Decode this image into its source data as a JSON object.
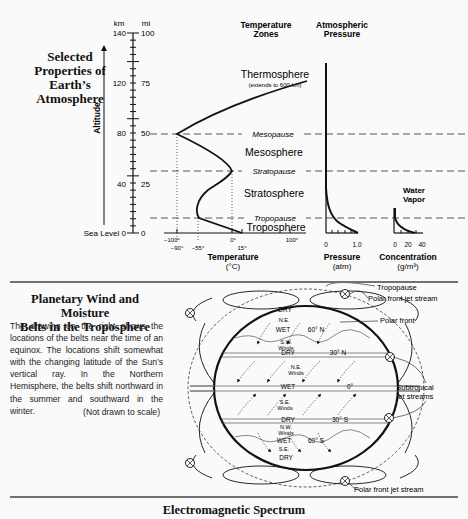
{
  "atmosphere": {
    "title": "Selected Properties of Earth’s Atmosphere",
    "title_lines": [
      "Selected",
      "Properties of",
      "Earth’s",
      "Atmosphere"
    ],
    "altitude_label": "Altitude",
    "km_label": "km",
    "mi_label": "mi",
    "km_ticks": [
      "140",
      "120",
      "80",
      "40",
      "Sea Level 0"
    ],
    "mi_ticks": [
      "100",
      "75",
      "50",
      "25",
      "0"
    ],
    "temperature_zones_header": [
      "Temperature",
      "Zones"
    ],
    "pressure_header": [
      "Atmospheric",
      "Pressure"
    ],
    "zones": {
      "thermosphere": "Thermosphere",
      "thermosphere_note": "(extends to 600 km)",
      "mesopause": "Mesopause",
      "mesosphere": "Mesosphere",
      "stratopause": "Stratopause",
      "stratosphere": "Stratosphere",
      "tropopause": "Tropopause",
      "troposphere": "Troposphere"
    },
    "temperature_axis": {
      "top_ticks": [
        "−100°",
        "0°",
        "100°"
      ],
      "bottom_ticks": [
        "−90°",
        "−55°",
        "15°"
      ],
      "label": "Temperature",
      "unit": "(°C)"
    },
    "pressure_axis": {
      "ticks": [
        "0",
        "1.0"
      ],
      "label": "Pressure",
      "unit": "(atm)"
    },
    "water_vapor": {
      "header": [
        "Water",
        "Vapor"
      ],
      "ticks": [
        "0",
        "20",
        "40"
      ],
      "label": "Concentration",
      "unit": "(g/m³)"
    }
  },
  "chart_data": {
    "type": "line",
    "ylabel": "Altitude (km)",
    "ylim": [
      0,
      140
    ],
    "boundaries_km": {
      "tropopause": 12,
      "stratopause": 50,
      "mesopause": 80
    },
    "series": [
      {
        "name": "Temperature (°C)",
        "xlim": [
          -100,
          100
        ],
        "points": [
          [
            15,
            0
          ],
          [
            -55,
            12
          ],
          [
            -50,
            20
          ],
          [
            -35,
            35
          ],
          [
            0,
            50
          ],
          [
            -40,
            65
          ],
          [
            -90,
            80
          ],
          [
            -20,
            100
          ],
          [
            15,
            125
          ]
        ]
      },
      {
        "name": "Pressure (atm)",
        "xlim": [
          0,
          1.0
        ],
        "points": [
          [
            1.0,
            0
          ],
          [
            0.5,
            5
          ],
          [
            0.2,
            12
          ],
          [
            0.08,
            20
          ],
          [
            0.02,
            35
          ],
          [
            0.001,
            50
          ],
          [
            0,
            80
          ],
          [
            0,
            125
          ]
        ]
      },
      {
        "name": "Water Vapor (g/m3)",
        "xlim": [
          0,
          40
        ],
        "points": [
          [
            20,
            0
          ],
          [
            5,
            5
          ],
          [
            1,
            10
          ],
          [
            0,
            15
          ]
        ]
      }
    ]
  },
  "planetary": {
    "title_lines": [
      "Planetary Wind and Moisture",
      "Belts in the Troposphere"
    ],
    "body": "The drawing on the right shows the locations of the belts near the time of an equinox. The locations shift somewhat with the changing latitude of the Sun’s vertical ray. In the Northern Hemisphere, the belts shift northward in the summer and southward in the winter.",
    "note": "(Not drawn to scale)",
    "callouts": {
      "tropopause": "Tropopause",
      "polar_jet_top": "Polar front jet stream",
      "polar_front": "Polar front",
      "subtropical": [
        "Subtropical",
        "jet streams"
      ],
      "polar_jet_bottom": "Polar front jet stream"
    },
    "belts": {
      "dry_top": "DRY",
      "ne_top": "N.E.",
      "wet_60n": "WET",
      "lat_60n": "60° N",
      "sw_winds": [
        "S.W.",
        "Winds"
      ],
      "dry_30n": "DRY",
      "lat_30n": "30° N",
      "ne_winds": [
        "N.E.",
        "Winds"
      ],
      "wet_eq": "WET",
      "lat_0": "0°",
      "se_winds": [
        "S.E.",
        "Winds"
      ],
      "dry_30s": "DRY",
      "lat_30s": "30° S",
      "nw_winds": [
        "N.W.",
        "Winds"
      ],
      "wet_60s": "WET",
      "lat_60s": "60° S",
      "se_bottom": "S.E.",
      "dry_bottom": "DRY"
    }
  },
  "spectrum": {
    "title": "Electromagnetic Spectrum"
  }
}
